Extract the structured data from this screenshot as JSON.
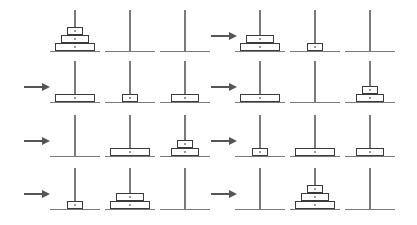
{
  "diagram": {
    "title": "",
    "type": "tower-of-hanoi-sequence",
    "colors": {
      "line": "#7a7a7a",
      "disk_border": "#3a3a3a",
      "arrow": "#555555",
      "background": "#ffffff"
    },
    "disk_widths": {
      "1": 16,
      "2": 28,
      "3": 40
    },
    "panels": [
      {
        "index": 1,
        "col": 0,
        "row": 0,
        "arrow": false,
        "pegs": [
          [
            3,
            2,
            1
          ],
          [],
          []
        ]
      },
      {
        "index": 2,
        "col": 1,
        "row": 0,
        "arrow": true,
        "pegs": [
          [
            3,
            2
          ],
          [
            1
          ],
          []
        ]
      },
      {
        "index": 3,
        "col": 0,
        "row": 1,
        "arrow": true,
        "pegs": [
          [
            3
          ],
          [
            1
          ],
          [
            2
          ]
        ]
      },
      {
        "index": 4,
        "col": 1,
        "row": 1,
        "arrow": true,
        "pegs": [
          [
            3
          ],
          [],
          [
            2,
            1
          ]
        ]
      },
      {
        "index": 5,
        "col": 0,
        "row": 2,
        "arrow": true,
        "pegs": [
          [],
          [
            3
          ],
          [
            2,
            1
          ]
        ]
      },
      {
        "index": 6,
        "col": 1,
        "row": 2,
        "arrow": true,
        "pegs": [
          [
            1
          ],
          [
            3
          ],
          [
            2
          ]
        ]
      },
      {
        "index": 7,
        "col": 0,
        "row": 3,
        "arrow": true,
        "pegs": [
          [
            1
          ],
          [
            3,
            2
          ],
          []
        ]
      },
      {
        "index": 8,
        "col": 1,
        "row": 3,
        "arrow": true,
        "pegs": [
          [],
          [
            3,
            2,
            1
          ],
          []
        ]
      }
    ]
  }
}
